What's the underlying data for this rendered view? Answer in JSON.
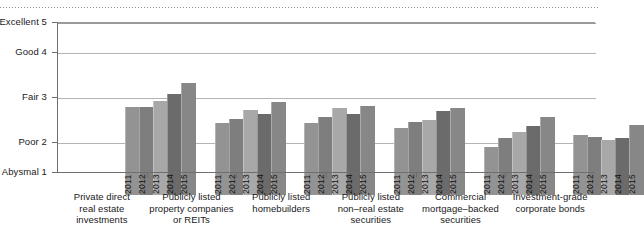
{
  "chart_data": {
    "type": "bar",
    "title": "",
    "subtitle": "",
    "xlabel": "",
    "ylabel": "",
    "grid": true,
    "legend_position": "none",
    "orientation": "vertical",
    "grouped": true,
    "ylim": [
      1,
      5
    ],
    "y_axis": {
      "ticks": [
        {
          "value": 5,
          "label": "Excellent 5"
        },
        {
          "value": 4,
          "label": "Good 4"
        },
        {
          "value": 3,
          "label": "Fair 3"
        },
        {
          "value": 2,
          "label": "Poor 2"
        },
        {
          "value": 1,
          "label": "Abysmal 1"
        }
      ]
    },
    "series": [
      {
        "name": "2011",
        "values": [
          3.28,
          2.93,
          2.93,
          2.83,
          2.4,
          2.67
        ]
      },
      {
        "name": "2012",
        "values": [
          3.29,
          3.03,
          3.06,
          2.96,
          2.61,
          2.63
        ]
      },
      {
        "name": "2013",
        "values": [
          3.43,
          3.23,
          3.27,
          3.0,
          2.74,
          2.55
        ]
      },
      {
        "name": "2014",
        "values": [
          3.57,
          3.13,
          3.14,
          3.21,
          2.86,
          2.6
        ]
      },
      {
        "name": "2015",
        "values": [
          3.82,
          3.41,
          3.32,
          3.27,
          3.06,
          2.88
        ]
      }
    ],
    "categories": [
      "Private direct\nreal estate\ninvestments",
      "Publicly listed\nproperty companies\nor REITs",
      "Publicly listed\nhomebuilders",
      "Publicly listed\nnon–real estate\nsecurities",
      "Commercial\nmortgage–backed\nsecurities",
      "Investment-grade\ncorporate bonds"
    ],
    "series_colors": [
      "#939393",
      "#7e7e7e",
      "#a8a8a8",
      "#6b6b6b",
      "#878787"
    ]
  }
}
